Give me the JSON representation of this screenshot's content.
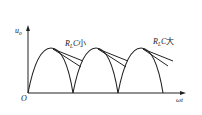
{
  "diagram": {
    "type": "full-wave rectifier with capacitor filter output waveform",
    "y_axis_label": "u",
    "y_axis_subscript": "o",
    "x_axis_label": "ωt",
    "origin_label": "O",
    "annotations": [
      {
        "text_main": "R",
        "text_sub": "L",
        "text_after": "C",
        "text_cjk": "小",
        "meaning": "small R_L·C — steeper discharge"
      },
      {
        "text_main": "R",
        "text_sub": "L",
        "text_after": "C",
        "text_cjk": "大",
        "meaning": "large R_L·C — shallower discharge"
      }
    ],
    "half_cycles": 3,
    "colors": {
      "stroke": "#222222",
      "background": "#ffffff"
    }
  }
}
